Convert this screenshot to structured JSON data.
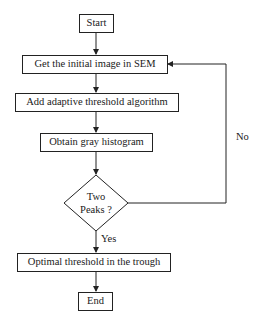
{
  "diagram": {
    "type": "flowchart",
    "nodes": {
      "start": "Start",
      "get_image": "Get the initial image in SEM",
      "add_algorithm": "Add adaptive threshold algorithm",
      "histogram": "Obtain gray histogram",
      "decision_line1": "Two",
      "decision_line2": "Peaks ?",
      "optimal": "Optimal threshold in the trough",
      "end": "End"
    },
    "edges": {
      "yes_label": "Yes",
      "no_label": "No"
    },
    "colors": {
      "stroke": "#222222",
      "background": "#ffffff"
    }
  }
}
